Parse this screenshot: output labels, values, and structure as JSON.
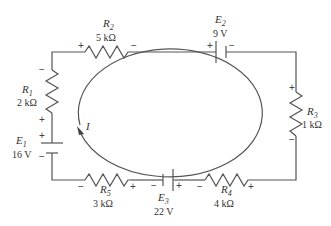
{
  "diagram": {
    "type": "series circuit loop",
    "loop_current": {
      "label": "I",
      "direction": "clockwise"
    },
    "components": {
      "R1": {
        "name": "R",
        "sub": "1",
        "value": "2 kΩ",
        "pol_top": "−",
        "pol_bottom": "+"
      },
      "R2": {
        "name": "R",
        "sub": "2",
        "value": "5 kΩ",
        "pol_left": "+",
        "pol_right": "−"
      },
      "R3": {
        "name": "R",
        "sub": "3",
        "value": "1 kΩ",
        "pol_top": "+",
        "pol_bottom": "−"
      },
      "R4": {
        "name": "R",
        "sub": "4",
        "value": "4 kΩ",
        "pol_left": "−",
        "pol_right": "+"
      },
      "R5": {
        "name": "R",
        "sub": "5",
        "value": "3 kΩ",
        "pol_left": "−",
        "pol_right": "+"
      },
      "E1": {
        "name": "E",
        "sub": "1",
        "value": "16 V",
        "pol_top": "+",
        "pol_bottom": "−"
      },
      "E2": {
        "name": "E",
        "sub": "2",
        "value": "9 V",
        "pol_left": "+",
        "pol_right": "−"
      },
      "E3": {
        "name": "E",
        "sub": "3",
        "value": "22 V",
        "pol_left": "−",
        "pol_right": "+"
      }
    },
    "colors": {
      "wire": "#555555",
      "text": "#333333"
    }
  }
}
